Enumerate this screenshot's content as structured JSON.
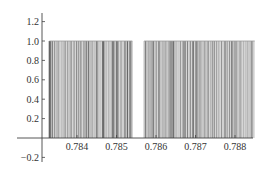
{
  "chart_data": {
    "type": "bar",
    "title": "",
    "xlabel": "",
    "ylabel": "",
    "xlim": [
      0.7831,
      0.7886
    ],
    "ylim": [
      -0.22,
      1.28
    ],
    "x_ticks": [
      0.784,
      0.785,
      0.786,
      0.787,
      0.788
    ],
    "x_tick_labels": [
      "0.784",
      "0.785",
      "0.786",
      "0.787",
      "0.788"
    ],
    "y_ticks": [
      -0.2,
      0.2,
      0.4,
      0.6,
      0.8,
      1.0,
      1.2
    ],
    "y_tick_labels": [
      "−0.2",
      "0.2",
      "0.4",
      "0.6",
      "0.8",
      "1.0",
      "1.2"
    ],
    "grid": false,
    "legend": null,
    "bar_height": 1.0,
    "segments": [
      {
        "x_start": 0.7833,
        "x_end": 0.7854
      },
      {
        "x_start": 0.7857,
        "x_end": 0.7885
      }
    ],
    "bar_color": "#808080"
  },
  "colors": {
    "axis": "#444444",
    "bar_light": "#b0b0b0",
    "bar_dark": "#6a6a6a",
    "background": "#ffffff"
  }
}
